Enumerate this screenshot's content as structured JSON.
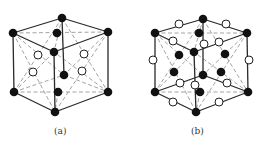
{
  "figure": {
    "panels": [
      {
        "id": "a",
        "label": "(a)",
        "label_pos": [
          62,
          134
        ],
        "solid_edges": [
          [
            [
              13,
              33
            ],
            [
              62,
              18
            ]
          ],
          [
            [
              62,
              18
            ],
            [
              108,
              32
            ]
          ],
          [
            [
              13,
              33
            ],
            [
              54,
              52
            ]
          ],
          [
            [
              54,
              52
            ],
            [
              108,
              32
            ]
          ],
          [
            [
              13,
              33
            ],
            [
              14,
              92
            ]
          ],
          [
            [
              108,
              32
            ],
            [
              108,
              92
            ]
          ],
          [
            [
              54,
              52
            ],
            [
              55,
              112
            ]
          ],
          [
            [
              14,
              92
            ],
            [
              55,
              112
            ]
          ],
          [
            [
              55,
              112
            ],
            [
              108,
              92
            ]
          ],
          [
            [
              62,
              18
            ],
            [
              64,
              75
            ]
          ]
        ],
        "dashed_edges": [
          [
            [
              13,
              33
            ],
            [
              108,
              32
            ]
          ],
          [
            [
              62,
              18
            ],
            [
              54,
              52
            ]
          ],
          [
            [
              14,
              92
            ],
            [
              64,
              75
            ]
          ],
          [
            [
              64,
              75
            ],
            [
              108,
              92
            ]
          ],
          [
            [
              14,
              92
            ],
            [
              108,
              92
            ]
          ],
          [
            [
              58,
              92
            ],
            [
              55,
              112
            ]
          ],
          [
            [
              13,
              33
            ],
            [
              55,
              112
            ]
          ],
          [
            [
              14,
              92
            ],
            [
              54,
              52
            ]
          ],
          [
            [
              108,
              32
            ],
            [
              55,
              112
            ]
          ],
          [
            [
              108,
              92
            ],
            [
              54,
              52
            ]
          ],
          [
            [
              13,
              33
            ],
            [
              64,
              75
            ]
          ],
          [
            [
              108,
              32
            ],
            [
              64,
              75
            ]
          ],
          [
            [
              62,
              18
            ],
            [
              14,
              92
            ]
          ],
          [
            [
              62,
              18
            ],
            [
              108,
              92
            ]
          ]
        ],
        "filled_atoms": [
          [
            62,
            18
          ],
          [
            13,
            33
          ],
          [
            108,
            32
          ],
          [
            57,
            33
          ],
          [
            54,
            52
          ],
          [
            64,
            75
          ],
          [
            14,
            92
          ],
          [
            108,
            92
          ],
          [
            58,
            92
          ],
          [
            55,
            112
          ]
        ],
        "open_atoms": [
          [
            38,
            55
          ],
          [
            84,
            54
          ],
          [
            33,
            72
          ],
          [
            82,
            71
          ]
        ]
      },
      {
        "id": "b",
        "label": "(b)",
        "label_pos": [
          199,
          134
        ],
        "solid_edges": [
          [
            [
              155,
              33
            ],
            [
              203,
              19
            ]
          ],
          [
            [
              203,
              19
            ],
            [
              247,
              33
            ]
          ],
          [
            [
              155,
              33
            ],
            [
              194,
              52
            ]
          ],
          [
            [
              194,
              52
            ],
            [
              247,
              33
            ]
          ],
          [
            [
              155,
              33
            ],
            [
              155,
              92
            ]
          ],
          [
            [
              247,
              33
            ],
            [
              248,
              92
            ]
          ],
          [
            [
              194,
              52
            ],
            [
              196,
              112
            ]
          ],
          [
            [
              155,
              92
            ],
            [
              196,
              112
            ]
          ],
          [
            [
              196,
              112
            ],
            [
              248,
              92
            ]
          ],
          [
            [
              203,
              19
            ],
            [
              203,
              75
            ]
          ],
          [
            [
              155,
              92
            ],
            [
              203,
              75
            ]
          ],
          [
            [
              203,
              75
            ],
            [
              248,
              92
            ]
          ]
        ],
        "dashed_edges": [
          [
            [
              155,
              33
            ],
            [
              247,
              33
            ]
          ],
          [
            [
              203,
              19
            ],
            [
              194,
              52
            ]
          ],
          [
            [
              155,
              92
            ],
            [
              248,
              92
            ]
          ],
          [
            [
              200,
              92
            ],
            [
              196,
              112
            ]
          ],
          [
            [
              155,
              33
            ],
            [
              196,
              112
            ]
          ],
          [
            [
              155,
              92
            ],
            [
              194,
              52
            ]
          ],
          [
            [
              247,
              33
            ],
            [
              196,
              112
            ]
          ],
          [
            [
              248,
              92
            ],
            [
              194,
              52
            ]
          ],
          [
            [
              155,
              33
            ],
            [
              203,
              75
            ]
          ],
          [
            [
              247,
              33
            ],
            [
              203,
              75
            ]
          ],
          [
            [
              203,
              19
            ],
            [
              155,
              92
            ]
          ],
          [
            [
              203,
              19
            ],
            [
              248,
              92
            ]
          ]
        ],
        "filled_atoms": [
          [
            203,
            19
          ],
          [
            155,
            33
          ],
          [
            247,
            33
          ],
          [
            199,
            33
          ],
          [
            194,
            52
          ],
          [
            203,
            75
          ],
          [
            155,
            92
          ],
          [
            248,
            92
          ],
          [
            200,
            92
          ],
          [
            196,
            112
          ],
          [
            179,
            55
          ],
          [
            225,
            54
          ],
          [
            174,
            72
          ],
          [
            221,
            72
          ]
        ],
        "open_atoms": [
          [
            179,
            24
          ],
          [
            226,
            24
          ],
          [
            173,
            41
          ],
          [
            204,
            44
          ],
          [
            219,
            42
          ],
          [
            153,
            60
          ],
          [
            249,
            60
          ],
          [
            180,
            83
          ],
          [
            195,
            85
          ],
          [
            227,
            83
          ],
          [
            173,
            102
          ],
          [
            219,
            102
          ]
        ]
      }
    ],
    "atom_radius_filled": 4.3,
    "atom_radius_open": 4.0
  }
}
